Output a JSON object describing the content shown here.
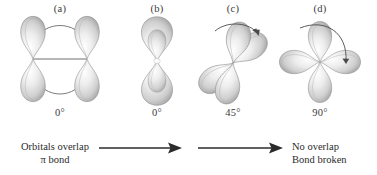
{
  "figure": {
    "background_color": "#ffffff",
    "ink_color": "#2b2b2b",
    "orbital_fill_light": "#f2f2f2",
    "orbital_fill_mid": "#c9c9c9",
    "orbital_fill_dark": "#9a9a9a",
    "orbital_stroke": "#8d8d8d"
  },
  "panels": [
    {
      "key": "a",
      "label": "(a)",
      "angle": "0°",
      "description": "two parallel p orbitals side by side with overlap arcs",
      "label_x": 60,
      "angle_x": 60
    },
    {
      "key": "b",
      "label": "(b)",
      "angle": "0°",
      "description": "p orbitals viewed end-on, fully overlapping",
      "label_x": 157,
      "angle_x": 157
    },
    {
      "key": "c",
      "label": "(c)",
      "angle": "45°",
      "description": "one p orbital rotated 45 degrees, partial overlap",
      "label_x": 233,
      "angle_x": 233
    },
    {
      "key": "d",
      "label": "(d)",
      "angle": "90°",
      "description": "p orbitals perpendicular, four-lobed cloverleaf, no overlap",
      "label_x": 320,
      "angle_x": 320
    }
  ],
  "rotation_arrows": [
    {
      "panel": "c",
      "name": "rotation-arrow-c"
    },
    {
      "panel": "d",
      "name": "rotation-arrow-d"
    }
  ],
  "flow": {
    "left_caption_line1": "Orbitals overlap",
    "left_caption_line2": "π bond",
    "right_caption_line1": "No overlap",
    "right_caption_line2": "Bond broken",
    "arrow_count": 2
  }
}
